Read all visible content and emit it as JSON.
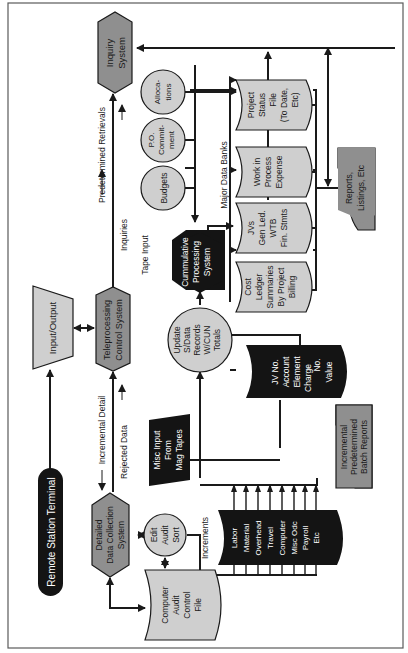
{
  "diagram": {
    "orientation": "rotated -90deg",
    "colors": {
      "background": "#ffffff",
      "border": "#5a5a5a",
      "line": "#1a1a1a",
      "light_fill": "#cfcfcf",
      "mid_fill": "#8f8f8f",
      "dark_fill": "#141414",
      "dark_text": "#ffffff",
      "light_text": "#1a1a1a"
    },
    "nodes": {
      "remote_terminal": {
        "label": "Remote Station Terminal",
        "shape": "terminator",
        "fill": "dark"
      },
      "input_output": {
        "label": "Input/Output",
        "shape": "manual-operation",
        "fill": "light"
      },
      "teleprocessing": {
        "line1": "Teleprocessing",
        "line2": "Control System",
        "shape": "hexagon",
        "fill": "mid"
      },
      "inquiry": {
        "line1": "Inquiry",
        "line2": "System",
        "shape": "hexagon",
        "fill": "mid"
      },
      "data_collection": {
        "line1": "Detailed",
        "line2": "Data Collection",
        "line3": "System",
        "shape": "hexagon",
        "fill": "mid"
      },
      "edit_audit": {
        "line1": "Edit",
        "line2": "Audit",
        "line3": "Sort",
        "shape": "circle",
        "fill": "light"
      },
      "audit_file": {
        "line1": "Computer",
        "line2": "Audit",
        "line3": "Control",
        "line4": "File",
        "shape": "storage",
        "fill": "light"
      },
      "increments": {
        "title": "Increments",
        "items": [
          "Labor",
          "Material",
          "Overhead",
          "Travel",
          "Computer",
          "Misc Odc",
          "Payroll",
          "Etc"
        ],
        "shape": "storage",
        "fill": "dark"
      },
      "misc_input": {
        "line1": "Misc Input",
        "line2": "From",
        "line3": "Mag Tapes",
        "shape": "manual-input",
        "fill": "dark"
      },
      "batch_reports": {
        "line1": "Incremental",
        "line2": "Predetermined",
        "line3": "Batch Reports",
        "shape": "document",
        "fill": "mid"
      },
      "update_records": {
        "line1": "Update",
        "line2": "S/Data",
        "line3": "Records",
        "line4": "W/CUN",
        "line5": "Totals",
        "shape": "circle",
        "fill": "light"
      },
      "jv_file": {
        "line1": "JV No.",
        "line2": "Account",
        "line3": "Element",
        "line4": "Charge",
        "line5": "No.",
        "line6": "Value",
        "shape": "storage",
        "fill": "dark"
      },
      "cumulative": {
        "line1": "Cummulative",
        "line2": "Processing",
        "line3": "System",
        "shape": "hexagon",
        "fill": "dark"
      },
      "budgets": {
        "label": "Budgets",
        "shape": "circle",
        "fill": "light"
      },
      "po_commitment": {
        "line1": "P.O.",
        "line2": "Commit-",
        "line3": "ment",
        "shape": "circle",
        "fill": "light"
      },
      "allocations": {
        "line1": "Alloca-",
        "line2": "tions",
        "shape": "circle",
        "fill": "light"
      },
      "bank_cost_ledger": {
        "line1": "Cost",
        "line2": "Ledger",
        "line3": "Summaries",
        "line4": "By Project",
        "line5": "Billing",
        "shape": "storage",
        "fill": "light"
      },
      "bank_jvs": {
        "line1": "JVs",
        "line2": "Gen Led.",
        "line3": "WTB",
        "line4": "Fin. Stmts",
        "shape": "storage",
        "fill": "light"
      },
      "bank_wip": {
        "line1": "Work in",
        "line2": "Process",
        "line3": "Expense",
        "shape": "storage",
        "fill": "light"
      },
      "bank_project_status": {
        "line1": "Project",
        "line2": "Status",
        "line3": "File",
        "line4": "(To Date,",
        "line5": "Etc)",
        "shape": "storage",
        "fill": "light"
      },
      "reports": {
        "line1": "Reports,",
        "line2": "Listings, Etc",
        "shape": "document",
        "fill": "mid"
      }
    },
    "annotations": {
      "predetermined_retrievals": "Predetermined Retrievals",
      "inquiries": "Inquiries",
      "incremental_detail": "Incremental Detail",
      "rejected_data": "Rejected Data",
      "tape_input": "Tape Input",
      "major_data_banks": "Major Data Banks"
    }
  }
}
